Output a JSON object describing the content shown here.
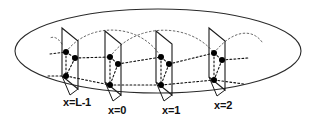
{
  "figure": {
    "background_color": "#ffffff",
    "line_color": "#1a1a1a",
    "dot_color": "#000000",
    "width": 320,
    "height": 126
  },
  "ellipse": {
    "name": "outer-boundary-ellipse",
    "cx": 158,
    "cy": 51,
    "rx": 143,
    "ry": 42,
    "stroke": "#2a2a2a",
    "stroke_width": 1.1,
    "fill": "none"
  },
  "slices": [
    {
      "id": "slice-0",
      "label": "x=L-1",
      "label_x": 63,
      "label_y": 106,
      "plane_points": "62,28 78,41 78,89 62,76",
      "leader": "62,76 70,95 78,89",
      "dots": [
        {
          "name": "dot-upper",
          "cx": 66,
          "cy": 52,
          "r": 3.0
        },
        {
          "name": "dot-middle",
          "cx": 75,
          "cy": 58,
          "r": 3.0
        },
        {
          "name": "dot-lower",
          "cx": 66,
          "cy": 76,
          "r": 3.0
        }
      ]
    },
    {
      "id": "slice-1",
      "label": "x=0",
      "label_x": 108,
      "label_y": 114,
      "plane_points": "105,31 121,44 121,95 105,82",
      "leader": "105,82 113,101 121,95",
      "dots": [
        {
          "name": "dot-upper",
          "cx": 110,
          "cy": 57,
          "r": 3.0
        },
        {
          "name": "dot-middle",
          "cx": 118,
          "cy": 64,
          "r": 3.0
        },
        {
          "name": "dot-lower",
          "cx": 110,
          "cy": 85,
          "r": 3.0
        }
      ]
    },
    {
      "id": "slice-2",
      "label": "x=1",
      "label_x": 162,
      "label_y": 114,
      "plane_points": "156,31 172,44 172,95 156,82",
      "leader": "156,82 164,101 172,95",
      "dots": [
        {
          "name": "dot-upper",
          "cx": 161,
          "cy": 57,
          "r": 3.0
        },
        {
          "name": "dot-middle",
          "cx": 169,
          "cy": 64,
          "r": 3.0
        },
        {
          "name": "dot-lower",
          "cx": 161,
          "cy": 85,
          "r": 3.0
        }
      ]
    },
    {
      "id": "slice-3",
      "label": "x=2",
      "label_x": 214,
      "label_y": 109,
      "plane_points": "209,28 225,41 225,90 209,77",
      "leader": "209,77 217,96 225,90",
      "dots": [
        {
          "name": "dot-upper",
          "cx": 214,
          "cy": 53,
          "r": 3.0
        },
        {
          "name": "dot-middle",
          "cx": 222,
          "cy": 60,
          "r": 3.0
        },
        {
          "name": "dot-lower",
          "cx": 214,
          "cy": 80,
          "r": 3.0
        }
      ]
    }
  ],
  "intra_slice_bonds": [
    {
      "name": "bond-upper-middle-0",
      "d": "M66,52 L75,58"
    },
    {
      "name": "bond-middle-lower-0",
      "d": "M75,58 L66,76"
    },
    {
      "name": "bond-upper-lower-0",
      "d": "M66,52 L66,76"
    },
    {
      "name": "bond-upper-middle-1",
      "d": "M110,57 L118,64"
    },
    {
      "name": "bond-middle-lower-1",
      "d": "M118,64 L110,85"
    },
    {
      "name": "bond-upper-lower-1",
      "d": "M110,57 L110,85"
    },
    {
      "name": "bond-upper-middle-2",
      "d": "M161,57 L169,64"
    },
    {
      "name": "bond-middle-lower-2",
      "d": "M169,64 L161,85"
    },
    {
      "name": "bond-upper-lower-2",
      "d": "M161,57 L161,85"
    },
    {
      "name": "bond-upper-middle-3",
      "d": "M214,53 L222,60"
    },
    {
      "name": "bond-middle-lower-3",
      "d": "M222,60 L214,80"
    },
    {
      "name": "bond-upper-lower-3",
      "d": "M214,53 L214,80"
    }
  ],
  "inter_slice_bonds": [
    {
      "name": "link-middle-0-1",
      "d": "M75,58 L110,57"
    },
    {
      "name": "link-lower-0-1",
      "d": "M66,76 L110,85"
    },
    {
      "name": "link-middle-1-2",
      "d": "M118,64 L161,57"
    },
    {
      "name": "link-lower-1-2",
      "d": "M110,85 L161,85"
    },
    {
      "name": "link-middle-2-3",
      "d": "M169,64 L214,53"
    },
    {
      "name": "link-lower-2-3",
      "d": "M161,85 L214,80"
    },
    {
      "name": "link-stub-left-upper",
      "d": "M50,54 L66,52"
    },
    {
      "name": "link-stub-left-lower",
      "d": "M48,76 L66,76"
    },
    {
      "name": "link-stub-right-middle",
      "d": "M222,60 L248,58"
    },
    {
      "name": "link-stub-right-lower",
      "d": "M214,80 L244,84"
    }
  ],
  "arcs": [
    {
      "name": "wrap-arc-back-left",
      "d": "M66,52 C88,22 140,22 161,57"
    },
    {
      "name": "wrap-arc-back-right",
      "d": "M110,57 C134,22 190,22 214,53"
    },
    {
      "name": "wrap-arc-tail-right",
      "d": "M214,53 C232,30 252,28 262,42"
    },
    {
      "name": "wrap-arc-tail-left",
      "d": "M62,44 C58,38 54,36 50,38"
    }
  ],
  "labels": {
    "slice_0": "x=L-1",
    "slice_1": "x=0",
    "slice_2": "x=1",
    "slice_3": "x=2"
  }
}
